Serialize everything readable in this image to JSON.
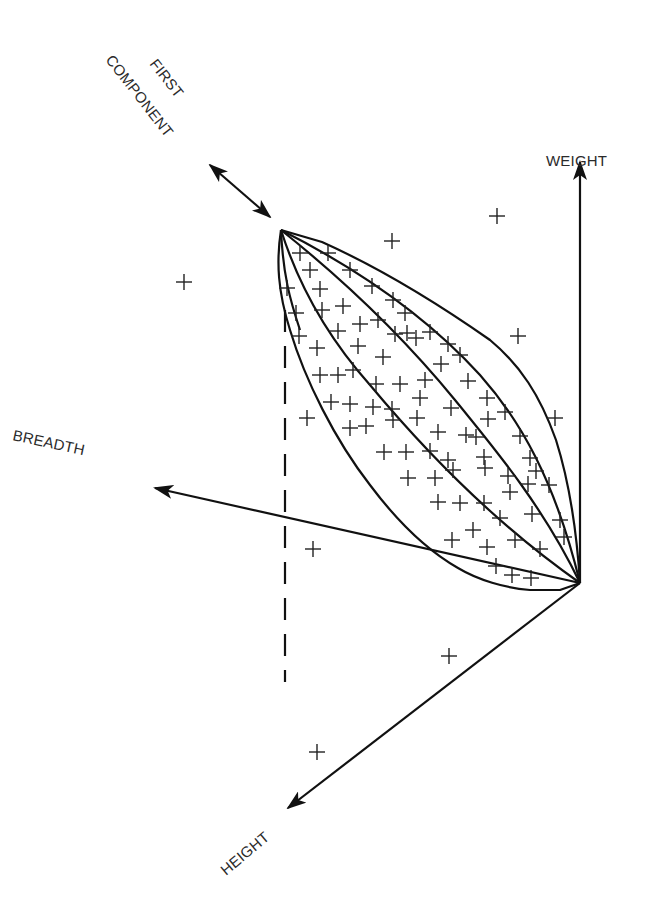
{
  "diagram": {
    "title": "",
    "labels": {
      "weight": "WEIGHT",
      "breadth": "BREADTH",
      "height": "HEIGHT",
      "first_component_line1": "FIRST",
      "first_component_line2": "COMPONENT"
    },
    "colors": {
      "stroke": "#111111",
      "text": "#2a2a2a",
      "background": "#ffffff"
    },
    "origin": [
      580,
      583
    ],
    "apex": [
      281,
      230
    ],
    "axes": [
      {
        "name": "weight",
        "from": [
          580,
          583
        ],
        "to": [
          580,
          162
        ]
      },
      {
        "name": "breadth",
        "from": [
          580,
          583
        ],
        "to": [
          155,
          488
        ]
      },
      {
        "name": "height",
        "from": [
          580,
          583
        ],
        "to": [
          288,
          808
        ]
      }
    ],
    "first_component_arrow": {
      "from": [
        210,
        165
      ],
      "to": [
        270,
        217
      ]
    },
    "dashed_projection": {
      "x": 285,
      "y_from": 310,
      "y_to": 682
    },
    "points_inside": [
      [
        300,
        253
      ],
      [
        328,
        253
      ],
      [
        310,
        270
      ],
      [
        287,
        288
      ],
      [
        320,
        289
      ],
      [
        350,
        270
      ],
      [
        372,
        286
      ],
      [
        393,
        300
      ],
      [
        405,
        313
      ],
      [
        296,
        313
      ],
      [
        322,
        310
      ],
      [
        343,
        306
      ],
      [
        360,
        324
      ],
      [
        378,
        320
      ],
      [
        407,
        333
      ],
      [
        430,
        332
      ],
      [
        448,
        344
      ],
      [
        299,
        336
      ],
      [
        317,
        348
      ],
      [
        338,
        331
      ],
      [
        358,
        346
      ],
      [
        395,
        334
      ],
      [
        383,
        357
      ],
      [
        416,
        338
      ],
      [
        460,
        355
      ],
      [
        320,
        375
      ],
      [
        338,
        375
      ],
      [
        353,
        370
      ],
      [
        376,
        384
      ],
      [
        400,
        384
      ],
      [
        425,
        380
      ],
      [
        441,
        364
      ],
      [
        468,
        381
      ],
      [
        331,
        402
      ],
      [
        350,
        404
      ],
      [
        373,
        407
      ],
      [
        392,
        409
      ],
      [
        420,
        398
      ],
      [
        451,
        408
      ],
      [
        487,
        398
      ],
      [
        505,
        412
      ],
      [
        307,
        418
      ],
      [
        350,
        428
      ],
      [
        366,
        426
      ],
      [
        393,
        420
      ],
      [
        417,
        418
      ],
      [
        438,
        432
      ],
      [
        466,
        435
      ],
      [
        488,
        419
      ],
      [
        520,
        436
      ],
      [
        384,
        452
      ],
      [
        406,
        452
      ],
      [
        430,
        451
      ],
      [
        448,
        460
      ],
      [
        476,
        437
      ],
      [
        484,
        457
      ],
      [
        508,
        476
      ],
      [
        530,
        458
      ],
      [
        536,
        471
      ],
      [
        408,
        478
      ],
      [
        435,
        478
      ],
      [
        453,
        470
      ],
      [
        485,
        468
      ],
      [
        510,
        492
      ],
      [
        528,
        484
      ],
      [
        549,
        485
      ],
      [
        438,
        502
      ],
      [
        460,
        503
      ],
      [
        484,
        503
      ],
      [
        500,
        518
      ],
      [
        532,
        514
      ],
      [
        560,
        520
      ],
      [
        452,
        540
      ],
      [
        473,
        530
      ],
      [
        487,
        547
      ],
      [
        515,
        540
      ],
      [
        540,
        549
      ],
      [
        564,
        537
      ],
      [
        496,
        566
      ],
      [
        512,
        575
      ],
      [
        531,
        578
      ]
    ],
    "points_outside": [
      [
        184,
        282
      ],
      [
        392,
        241
      ],
      [
        497,
        216
      ],
      [
        518,
        336
      ],
      [
        555,
        418
      ],
      [
        313,
        549
      ],
      [
        449,
        656
      ],
      [
        317,
        752
      ]
    ]
  }
}
